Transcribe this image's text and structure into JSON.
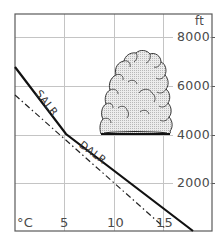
{
  "diagram": {
    "title": "",
    "x_axis": {
      "unit_label": "°C",
      "ticks": [
        {
          "value": 5,
          "label": "5"
        },
        {
          "value": 10,
          "label": "10"
        },
        {
          "value": 15,
          "label": "15"
        }
      ],
      "range": [
        0,
        20
      ]
    },
    "y_axis": {
      "unit_label": "ft",
      "ticks": [
        {
          "value": 2000,
          "label": "2000"
        },
        {
          "value": 4000,
          "label": "4000"
        },
        {
          "value": 6000,
          "label": "6000"
        },
        {
          "value": 8000,
          "label": "8000"
        }
      ],
      "range": [
        0,
        9500
      ],
      "position": "right"
    },
    "lines": [
      {
        "name": "environment-temperature-profile",
        "style": "solid",
        "points": [
          [
            0,
            6750
          ],
          [
            5.2,
            4000
          ],
          [
            18,
            0
          ]
        ],
        "segment_labels": [
          {
            "text": "SALR",
            "segment": "upper"
          },
          {
            "text": "DALR",
            "segment": "lower"
          }
        ]
      },
      {
        "name": "dew-point-line",
        "style": "dash-dot",
        "points": [
          [
            0,
            5600
          ],
          [
            15.2,
            100
          ]
        ]
      }
    ],
    "cloud": {
      "type": "cumulus",
      "base_ft": 4000,
      "top_ft": 7400,
      "x_range_c": [
        8.6,
        16
      ]
    },
    "labels": {
      "salr": "SALR",
      "dalr": "DALR",
      "unit_x": "°C",
      "unit_y": "ft"
    },
    "colors": {
      "frame": "#555555",
      "grid": "#bdbdbd",
      "line": "#111111",
      "text": "#4a4a4a",
      "cloud_fill": "#e4e4e4",
      "cloud_edge": "#222222"
    }
  }
}
